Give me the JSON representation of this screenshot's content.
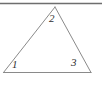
{
  "figure": {
    "name": "triangle-with-numbered-angles",
    "background_color": "#ffffff",
    "line_color": "#8a8a8a",
    "label_color": "#2f2f2f",
    "top_rule": {
      "name": "top-horizontal-rule",
      "color": "#6e6e6e",
      "y": 3.5,
      "x_start": 0,
      "x_end": 102
    },
    "triangle": {
      "vertices": {
        "apex": {
          "x": 55,
          "y": 7
        },
        "bottom_left": {
          "x": 3.5,
          "y": 72.5
        },
        "bottom_right": {
          "x": 91,
          "y": 72.5
        }
      },
      "stroke_width": 1
    },
    "angle_labels": [
      {
        "id": "1",
        "text": "1",
        "vertex": "bottom-left",
        "x": 12,
        "y": 59
      },
      {
        "id": "2",
        "text": "2",
        "vertex": "apex",
        "x": 49,
        "y": 13
      },
      {
        "id": "3",
        "text": "3",
        "vertex": "bottom-right",
        "x": 71,
        "y": 57
      }
    ]
  }
}
